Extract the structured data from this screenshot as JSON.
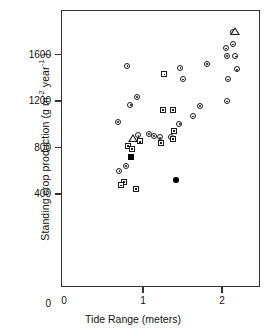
{
  "chart_data": {
    "type": "scatter",
    "title": "",
    "xlabel": "Tide Range (meters)",
    "ylabel_parts": {
      "pre": "Standing crop production (g m",
      "sup1": "-2",
      "mid": " year",
      "sup2": "-1",
      "post": " )"
    },
    "ylabel_plain": "Standing crop production (g m-2 year-1 )",
    "xlim": [
      0,
      2.48
    ],
    "ylim": [
      0,
      1810
    ],
    "xticks": [
      0,
      1,
      2
    ],
    "xticklabels": [
      "0",
      "1",
      "2"
    ],
    "yticks": [
      0,
      400,
      800,
      1200,
      1600
    ],
    "yticklabels": [
      "0",
      "400",
      "800",
      "1200",
      "1600"
    ],
    "grid": false,
    "legend": "none",
    "axis_origin_label": "0",
    "series": [
      {
        "name": "open-circle",
        "marker": "circle",
        "points": [
          [
            0.68,
            1023
          ],
          [
            0.8,
            1502
          ],
          [
            0.84,
            1166
          ],
          [
            0.92,
            1235
          ],
          [
            0.7,
            597
          ],
          [
            0.78,
            641
          ],
          [
            0.94,
            904
          ],
          [
            1.07,
            920
          ],
          [
            1.14,
            899
          ],
          [
            1.21,
            887
          ],
          [
            1.36,
            890
          ],
          [
            1.46,
            1004
          ],
          [
            1.5,
            1388
          ],
          [
            1.47,
            1483
          ],
          [
            1.63,
            1069
          ],
          [
            1.72,
            1158
          ],
          [
            1.81,
            1520
          ],
          [
            2.06,
            1198
          ],
          [
            2.07,
            1388
          ],
          [
            2.06,
            1588
          ],
          [
            2.05,
            1654
          ],
          [
            2.14,
            1689
          ],
          [
            2.17,
            1586
          ],
          [
            2.19,
            1472
          ],
          [
            2.14,
            1790
          ]
        ]
      },
      {
        "name": "open-square",
        "marker": "square",
        "points": [
          [
            0.76,
            507
          ],
          [
            0.72,
            474
          ],
          [
            0.91,
            444
          ],
          [
            0.81,
            817
          ],
          [
            1.25,
            1122
          ],
          [
            1.38,
            1122
          ],
          [
            1.27,
            1430
          ],
          [
            1.39,
            945
          ],
          [
            1.38,
            873
          ],
          [
            1.23,
            839
          ],
          [
            0.96,
            852
          ],
          [
            0.86,
            788
          ]
        ]
      },
      {
        "name": "filled-square",
        "marker": "filled-square",
        "points": [
          [
            0.85,
            717
          ]
        ]
      },
      {
        "name": "filled-circle",
        "marker": "filled-circle",
        "points": [
          [
            1.42,
            519
          ]
        ]
      },
      {
        "name": "open-triangle",
        "marker": "triangle",
        "points": [
          [
            0.87,
            877
          ],
          [
            2.17,
            1795
          ]
        ]
      }
    ]
  }
}
